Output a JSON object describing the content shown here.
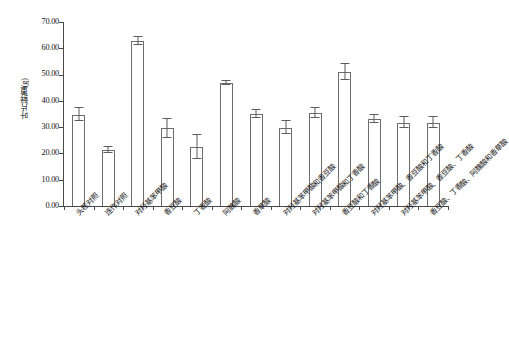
{
  "chart_data": {
    "type": "bar",
    "title": "",
    "xlabel": "",
    "ylabel": "叶片鲜重(g)",
    "ylim": [
      0,
      70
    ],
    "ytick_labels": [
      "0.00",
      "10.00",
      "20.00",
      "30.00",
      "40.00",
      "50.00",
      "60.00",
      "70.00"
    ],
    "ytick_values": [
      0,
      10,
      20,
      30,
      40,
      50,
      60,
      70
    ],
    "grid": false,
    "legend": "none",
    "categories": [
      "头茬对照",
      "连作对照",
      "对羟基苯甲酸",
      "香豆酸",
      "丁香酸",
      "阿魏酸",
      "香草酸",
      "对羟基苯甲酸和香豆酸",
      "对羟基苯甲酸和丁香酸",
      "香豆酸和丁香酸",
      "对羟基苯甲酸、香豆酸和丁香酸",
      "对羟基苯甲酸、香豆酸、丁香酸",
      "香豆酸、丁香酸、阿魏酸和香草酸"
    ],
    "values": [
      34.8,
      21.2,
      62.8,
      29.5,
      22.6,
      46.9,
      34.9,
      29.8,
      35.3,
      50.9,
      33.1,
      31.6,
      31.6
    ],
    "errors": [
      2.6,
      1.1,
      1.6,
      3.6,
      4.6,
      0.8,
      1.6,
      2.4,
      1.9,
      3.1,
      1.6,
      2.1,
      2.1
    ],
    "series": [
      {
        "name": "叶片鲜重",
        "values": [
          34.8,
          21.2,
          62.8,
          29.5,
          22.6,
          46.9,
          34.9,
          29.8,
          35.3,
          50.9,
          33.1,
          31.6,
          31.6
        ]
      }
    ]
  },
  "axis": {
    "y_title": "叶片鲜重(g)"
  }
}
